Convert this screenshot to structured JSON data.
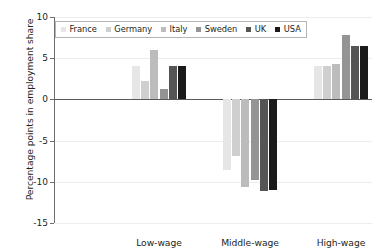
{
  "chart_data": {
    "type": "bar",
    "title": "",
    "subtitle": "",
    "xlabel": "",
    "ylabel": "Percentage points in employment share",
    "categories": [
      "Low-wage",
      "Middle-wage",
      "High-wage"
    ],
    "ylim": [
      -15,
      10
    ],
    "yticks": [
      10,
      5,
      0,
      -5,
      -10,
      -15
    ],
    "ytick_labels": [
      "10",
      "5",
      "0",
      "-5",
      "-10",
      "-15"
    ],
    "grid": true,
    "grid_axis": "y",
    "legend_position": "top-left",
    "zero_line": true,
    "series": [
      {
        "name": "France",
        "color": "#e6e6e6",
        "values": [
          4.0,
          -8.6,
          4.1
        ]
      },
      {
        "name": "Germany",
        "color": "#cfcfcf",
        "values": [
          2.2,
          -6.9,
          4.1
        ]
      },
      {
        "name": "Italy",
        "color": "#bcbcbc",
        "values": [
          6.0,
          -10.6,
          4.3
        ]
      },
      {
        "name": "Sweden",
        "color": "#949494",
        "values": [
          1.3,
          -9.8,
          7.8
        ]
      },
      {
        "name": "UK",
        "color": "#555555",
        "values": [
          4.1,
          -11.1,
          6.5
        ]
      },
      {
        "name": "USA",
        "color": "#1a1a1a",
        "values": [
          4.1,
          -11.0,
          6.5
        ]
      }
    ]
  },
  "axis_colors": {
    "spine": "#6d6e70",
    "gridline": "#ededed",
    "zero": "#58595b",
    "text": "#231f20",
    "legend_border": "#b5b5b5",
    "background": "#ffffff"
  }
}
